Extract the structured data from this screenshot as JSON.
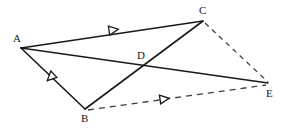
{
  "figure": {
    "type": "geometry-diagram",
    "canvas": {
      "width": 287,
      "height": 134,
      "background": "#ffffff"
    },
    "stroke_color": "#1a1a1a",
    "dash_color": "#4a4a4a",
    "points": [
      {
        "id": "A",
        "label": "A",
        "x": 21,
        "y": 48,
        "label_x": 13,
        "label_y": 33
      },
      {
        "id": "B",
        "label": "B",
        "x": 85,
        "y": 109,
        "label_x": 81,
        "label_y": 113
      },
      {
        "id": "C",
        "label": "C",
        "x": 203,
        "y": 21,
        "label_x": 199,
        "label_y": 5
      },
      {
        "id": "D",
        "label": "D",
        "x": 143,
        "y": 66,
        "label_x": 137,
        "label_y": 50
      },
      {
        "id": "E",
        "label": "E",
        "x": 268,
        "y": 83,
        "label_x": 266,
        "label_y": 88
      }
    ],
    "segments": [
      {
        "id": "AC",
        "from": "A",
        "to": "C",
        "style": "solid",
        "marker": "single-arrow"
      },
      {
        "id": "AB",
        "from": "A",
        "to": "B",
        "style": "solid",
        "marker": "single-arrow"
      },
      {
        "id": "AE",
        "from": "A",
        "to": "E",
        "style": "solid",
        "marker": "none"
      },
      {
        "id": "BC",
        "from": "B",
        "to": "C",
        "style": "solid",
        "marker": "none"
      },
      {
        "id": "BE",
        "from": "B",
        "to": "E",
        "style": "dashed",
        "marker": "single-arrow"
      },
      {
        "id": "CE",
        "from": "C",
        "to": "E",
        "style": "dashed",
        "marker": "none"
      }
    ],
    "markers": [
      {
        "id": "marker-ac",
        "on_segment": "AC",
        "x": 113,
        "y": 30,
        "angle": -8.5,
        "shape": "open-triangle"
      },
      {
        "id": "marker-ab",
        "on_segment": "AB",
        "x": 51,
        "y": 77,
        "angle": 136,
        "shape": "open-triangle"
      },
      {
        "id": "marker-be",
        "on_segment": "BE",
        "x": 164,
        "y": 99,
        "angle": -8.0,
        "shape": "open-triangle"
      }
    ]
  }
}
